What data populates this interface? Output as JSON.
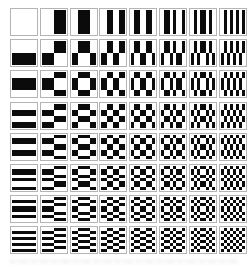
{
  "figure": {
    "kind": "walsh-hadamard-basis-image-grid",
    "grid_rows": 8,
    "grid_cols": 8,
    "units_per_cell": 8,
    "order": "sequency",
    "combination_rule": "unit (i,j) of cell (r,c) is black where patterns_1d[r][i] differs from patterns_1d[c][j], white where they match",
    "patterns_1d": [
      [
        1,
        1,
        1,
        1,
        1,
        1,
        1,
        1
      ],
      [
        1,
        1,
        1,
        1,
        0,
        0,
        0,
        0
      ],
      [
        1,
        1,
        0,
        0,
        0,
        0,
        1,
        1
      ],
      [
        1,
        1,
        0,
        0,
        1,
        1,
        0,
        0
      ],
      [
        1,
        0,
        0,
        1,
        1,
        0,
        0,
        1
      ],
      [
        1,
        0,
        0,
        1,
        0,
        1,
        1,
        0
      ],
      [
        1,
        0,
        1,
        0,
        0,
        1,
        0,
        1
      ],
      [
        1,
        0,
        1,
        0,
        1,
        0,
        1,
        0
      ]
    ],
    "colors": {
      "positive_white": "#ffffff",
      "negative_black": "#0b0b0b",
      "cell_border_gray": "#b4b4b4",
      "page_background": "#ffffff"
    },
    "layout": {
      "origin_x": 10,
      "origin_y": 8,
      "pitch_x": 29.8,
      "pitch_y": 31.2,
      "cell_outer_px": 28,
      "pattern_px": 24,
      "inset_px": 1
    }
  }
}
